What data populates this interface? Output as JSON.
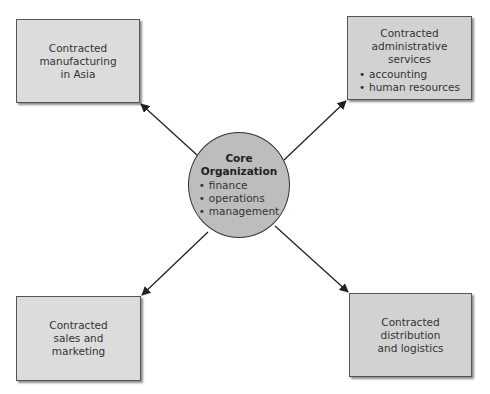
{
  "colors": {
    "box_fill": "#dcdcdc",
    "box_fill_dark": "#d2d2d2",
    "circle_fill": "#bdbdbd",
    "line": "#222222",
    "text": "#333333"
  },
  "core": {
    "title": "Core\nOrganization",
    "items": [
      "finance",
      "operations",
      "management"
    ]
  },
  "nodes": {
    "top_left": {
      "title": "Contracted\nmanufacturing\nin Asia"
    },
    "top_right": {
      "title": "Contracted\nadministrative\nservices",
      "items": [
        "accounting",
        "human resources"
      ]
    },
    "bottom_left": {
      "title": "Contracted\nsales and\nmarketing"
    },
    "bottom_right": {
      "title": "Contracted\ndistribution\nand logistics"
    }
  }
}
